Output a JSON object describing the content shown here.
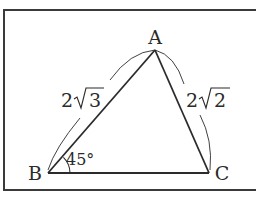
{
  "figure": {
    "type": "triangle",
    "colors": {
      "stroke": "#2b2b2b",
      "frame": "#3a3a3a",
      "background": "#ffffff"
    },
    "vertices": {
      "A": {
        "label": "A",
        "x": 155,
        "y": 50
      },
      "B": {
        "label": "B",
        "x": 48,
        "y": 173
      },
      "C": {
        "label": "C",
        "x": 209,
        "y": 173
      }
    },
    "sides": {
      "AB": {
        "label_coef": "2",
        "label_radicand": "3",
        "label_text": "2√3"
      },
      "AC": {
        "label_coef": "2",
        "label_radicand": "2",
        "label_text": "2√2"
      }
    },
    "angles": {
      "B": {
        "label": "45°",
        "value_deg": 45
      }
    }
  }
}
